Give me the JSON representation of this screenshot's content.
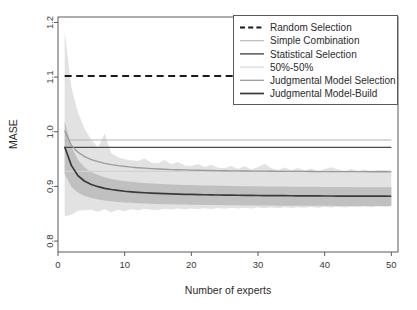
{
  "chart_data": {
    "type": "line",
    "title": "",
    "xlabel": "Number of experts",
    "ylabel": "MASE",
    "xlim": [
      0,
      51
    ],
    "ylim": [
      0.78,
      1.21
    ],
    "grid": false,
    "legend_position": "top-right",
    "xticks": [
      0,
      10,
      20,
      30,
      40,
      50
    ],
    "xticklabels": [
      "0",
      "10",
      "20",
      "30",
      "40",
      "50"
    ],
    "yticks": [
      0.8,
      0.9,
      1.0,
      1.1,
      1.2
    ],
    "yticklabels": [
      "0.8",
      "0.9",
      "1.0",
      "1.1",
      "1.2"
    ],
    "x": [
      1,
      2,
      3,
      4,
      5,
      6,
      7,
      8,
      9,
      10,
      11,
      12,
      13,
      14,
      15,
      16,
      17,
      18,
      19,
      20,
      21,
      22,
      23,
      24,
      25,
      26,
      27,
      28,
      29,
      30,
      31,
      32,
      33,
      34,
      35,
      36,
      37,
      38,
      39,
      40,
      41,
      42,
      43,
      44,
      45,
      46,
      47,
      48,
      49,
      50
    ],
    "series": [
      {
        "name": "Random Selection",
        "style": "dashed",
        "color": "#1a1a1a",
        "width": 2.2,
        "constant": 1.102,
        "values": [
          1.102,
          1.102,
          1.102,
          1.102,
          1.102,
          1.102,
          1.102,
          1.102,
          1.102,
          1.102,
          1.102,
          1.102,
          1.102,
          1.102,
          1.102,
          1.102,
          1.102,
          1.102,
          1.102,
          1.102,
          1.102,
          1.102,
          1.102,
          1.102,
          1.102,
          1.102,
          1.102,
          1.102,
          1.102,
          1.102,
          1.102,
          1.102,
          1.102,
          1.102,
          1.102,
          1.102,
          1.102,
          1.102,
          1.102,
          1.102,
          1.102,
          1.102,
          1.102,
          1.102,
          1.102,
          1.102,
          1.102,
          1.102,
          1.102,
          1.102
        ]
      },
      {
        "name": "Simple Combination",
        "style": "solid",
        "color": "#b4b4b4",
        "width": 1.1,
        "constant": 0.985,
        "values": [
          0.985,
          0.985,
          0.985,
          0.985,
          0.985,
          0.985,
          0.985,
          0.985,
          0.985,
          0.985,
          0.985,
          0.985,
          0.985,
          0.985,
          0.985,
          0.985,
          0.985,
          0.985,
          0.985,
          0.985,
          0.985,
          0.985,
          0.985,
          0.985,
          0.985,
          0.985,
          0.985,
          0.985,
          0.985,
          0.985,
          0.985,
          0.985,
          0.985,
          0.985,
          0.985,
          0.985,
          0.985,
          0.985,
          0.985,
          0.985,
          0.985,
          0.985,
          0.985,
          0.985,
          0.985,
          0.985,
          0.985,
          0.985,
          0.985,
          0.985
        ]
      },
      {
        "name": "Statistical Selection",
        "style": "solid",
        "color": "#4a4a4a",
        "width": 1.4,
        "constant": 0.9715,
        "values": [
          0.9715,
          0.9715,
          0.9715,
          0.9715,
          0.9715,
          0.9715,
          0.9715,
          0.9715,
          0.9715,
          0.9715,
          0.9715,
          0.9715,
          0.9715,
          0.9715,
          0.9715,
          0.9715,
          0.9715,
          0.9715,
          0.9715,
          0.9715,
          0.9715,
          0.9715,
          0.9715,
          0.9715,
          0.9715,
          0.9715,
          0.9715,
          0.9715,
          0.9715,
          0.9715,
          0.9715,
          0.9715,
          0.9715,
          0.9715,
          0.9715,
          0.9715,
          0.9715,
          0.9715,
          0.9715,
          0.9715,
          0.9715,
          0.9715,
          0.9715,
          0.9715,
          0.9715,
          0.9715,
          0.9715,
          0.9715,
          0.9715,
          0.9715
        ]
      },
      {
        "name": "50%-50%",
        "style": "solid",
        "color": "#d2d2d2",
        "width": 1.1,
        "constant": 0.9275,
        "values": [
          0.9275,
          0.9275,
          0.9275,
          0.9275,
          0.9275,
          0.9275,
          0.9275,
          0.9275,
          0.9275,
          0.9275,
          0.9275,
          0.9275,
          0.9275,
          0.9275,
          0.9275,
          0.9275,
          0.9275,
          0.9275,
          0.9275,
          0.9275,
          0.9275,
          0.9275,
          0.9275,
          0.9275,
          0.9275,
          0.9275,
          0.9275,
          0.9275,
          0.9275,
          0.9275,
          0.9275,
          0.9275,
          0.9275,
          0.9275,
          0.9275,
          0.9275,
          0.9275,
          0.9275,
          0.9275,
          0.9275,
          0.9275,
          0.9275,
          0.9275,
          0.9275,
          0.9275,
          0.9275,
          0.9275,
          0.9275,
          0.9275,
          0.9275
        ]
      },
      {
        "name": "Judgmental Model Selection",
        "style": "solid",
        "color": "#9a9a9a",
        "width": 1.3,
        "values": [
          1.002,
          0.9755,
          0.9625,
          0.9545,
          0.949,
          0.9452,
          0.9422,
          0.9399,
          0.938,
          0.9365,
          0.9352,
          0.9342,
          0.9333,
          0.9326,
          0.9319,
          0.9314,
          0.9309,
          0.9305,
          0.9302,
          0.9299,
          0.9296,
          0.9293,
          0.9291,
          0.9289,
          0.9287,
          0.9285,
          0.9284,
          0.9282,
          0.9281,
          0.928,
          0.9279,
          0.9278,
          0.9277,
          0.9276,
          0.9275,
          0.9274,
          0.9274,
          0.9273,
          0.9272,
          0.9272,
          0.9271,
          0.9271,
          0.927,
          0.927,
          0.9269,
          0.9269,
          0.9268,
          0.9268,
          0.9268,
          0.9267
        ]
      },
      {
        "name": "Judgmental Model-Build",
        "style": "solid",
        "color": "#3a3a3a",
        "width": 1.7,
        "values": [
          0.9725,
          0.9385,
          0.9195,
          0.9095,
          0.9035,
          0.8995,
          0.8965,
          0.8943,
          0.8926,
          0.8912,
          0.8901,
          0.8892,
          0.8884,
          0.8878,
          0.8872,
          0.8867,
          0.8863,
          0.8859,
          0.8856,
          0.8853,
          0.885,
          0.8848,
          0.8845,
          0.8843,
          0.8842,
          0.884,
          0.8838,
          0.8837,
          0.8836,
          0.8834,
          0.8833,
          0.8832,
          0.8831,
          0.883,
          0.8829,
          0.8828,
          0.8828,
          0.8827,
          0.8826,
          0.8825,
          0.8825,
          0.8824,
          0.8824,
          0.8823,
          0.8823,
          0.8822,
          0.8822,
          0.8821,
          0.8821,
          0.882
        ]
      }
    ],
    "bands": [
      {
        "name": "outer-band-judgmental-model-build",
        "color": "#e2e2e2",
        "opacity": 1,
        "upper": [
          1.185,
          1.082,
          1.035,
          1.005,
          0.9855,
          0.971,
          0.9962,
          0.9605,
          0.9535,
          0.9498,
          0.9478,
          0.9465,
          0.9512,
          0.9435,
          0.9425,
          0.9482,
          0.9405,
          0.9448,
          0.9382,
          0.9372,
          0.9412,
          0.9355,
          0.9398,
          0.9342,
          0.9335,
          0.9375,
          0.9325,
          0.9368,
          0.9315,
          0.9352,
          0.9415,
          0.9332,
          0.9302,
          0.9348,
          0.9295,
          0.9338,
          0.9288,
          0.9325,
          0.9282,
          0.9318,
          0.9352,
          0.9312,
          0.9275,
          0.9322,
          0.9272,
          0.9308,
          0.9268,
          0.9302,
          0.9295,
          0.9288
        ],
        "lower": [
          0.845,
          0.848,
          0.8555,
          0.8565,
          0.8575,
          0.8535,
          0.858,
          0.8528,
          0.8575,
          0.8545,
          0.8582,
          0.8562,
          0.8585,
          0.8572,
          0.8565,
          0.8592,
          0.8578,
          0.8595,
          0.8582,
          0.8598,
          0.8585,
          0.8602,
          0.8588,
          0.8605,
          0.8592,
          0.8608,
          0.8595,
          0.861,
          0.8598,
          0.8612,
          0.86,
          0.8615,
          0.8602,
          0.8618,
          0.8605,
          0.862,
          0.8608,
          0.8622,
          0.861,
          0.8625,
          0.8612,
          0.8628,
          0.8615,
          0.863,
          0.8618,
          0.8632,
          0.862,
          0.8635,
          0.8622,
          0.8638
        ]
      },
      {
        "name": "inner-band-judgmental-model-build",
        "color": "#c0c0c0",
        "opacity": 1,
        "upper": [
          1.0195,
          0.9735,
          0.9485,
          0.9345,
          0.9265,
          0.9208,
          0.9168,
          0.9138,
          0.9115,
          0.9098,
          0.9084,
          0.9072,
          0.9062,
          0.9054,
          0.9047,
          0.9041,
          0.9036,
          0.9031,
          0.9027,
          0.9024,
          0.902,
          0.9017,
          0.9015,
          0.9012,
          0.901,
          0.9008,
          0.9006,
          0.9005,
          0.9003,
          0.9002,
          0.9,
          0.8999,
          0.8998,
          0.8997,
          0.8995,
          0.8994,
          0.8993,
          0.8993,
          0.8992,
          0.8991,
          0.899,
          0.8989,
          0.8989,
          0.8988,
          0.8987,
          0.8987,
          0.8986,
          0.8986,
          0.8985,
          0.8985
        ],
        "lower": [
          0.9225,
          0.8995,
          0.8885,
          0.8825,
          0.8788,
          0.8762,
          0.8742,
          0.8728,
          0.8716,
          0.8707,
          0.8699,
          0.8693,
          0.8687,
          0.8683,
          0.8679,
          0.8675,
          0.8672,
          0.8669,
          0.8667,
          0.8665,
          0.8663,
          0.8661,
          0.8659,
          0.8658,
          0.8656,
          0.8655,
          0.8654,
          0.8653,
          0.8652,
          0.8651,
          0.865,
          0.8649,
          0.8648,
          0.8648,
          0.8647,
          0.8646,
          0.8646,
          0.8645,
          0.8645,
          0.8644,
          0.8644,
          0.8643,
          0.8643,
          0.8642,
          0.8642,
          0.8642,
          0.8641,
          0.8641,
          0.8641,
          0.864
        ]
      }
    ]
  },
  "legend": {
    "items": [
      {
        "label": "Random Selection",
        "swatch": "dashed-line-swatch"
      },
      {
        "label": "Simple Combination",
        "swatch": "solid-line-swatch"
      },
      {
        "label": "Statistical Selection",
        "swatch": "solid-line-swatch"
      },
      {
        "label": "50%-50%",
        "swatch": "solid-line-swatch"
      },
      {
        "label": "Judgmental Model Selection",
        "swatch": "solid-line-swatch"
      },
      {
        "label": "Judgmental Model-Build",
        "swatch": "solid-line-swatch"
      }
    ]
  }
}
